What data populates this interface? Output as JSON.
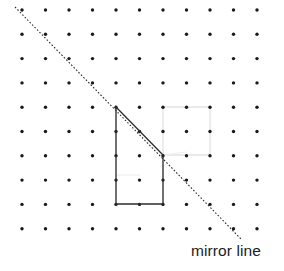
{
  "figure": {
    "background_color": "#ffffff",
    "width": 284,
    "height": 271
  },
  "labels": {
    "mirror_line": "mirror line"
  },
  "colors": {
    "dot": "#1a1a1a",
    "mirror_line": "#2b2b2b",
    "shape_outline": "#2d2d2d",
    "ghost_outline": "#e4e4e4",
    "text": "#1c1c1c"
  },
  "grid": {
    "kind": "square-dot-lattice",
    "columns": 11,
    "rows": 10,
    "x_start": 22,
    "y_start": 10,
    "spacing_x": 23.5,
    "spacing_y": 24.3,
    "dot_radius": 1.7,
    "xs": [
      22,
      45.5,
      69,
      92.5,
      116,
      139.5,
      163,
      186.5,
      210,
      233.5,
      257
    ],
    "ys": [
      10,
      34.3,
      58.6,
      82.9,
      107.2,
      131.5,
      155.8,
      180.1,
      204.4,
      228.7
    ]
  },
  "mirror_line": {
    "style": "dashed",
    "x1": 15,
    "y1": 7,
    "x2": 242,
    "y2": 240,
    "slope_description": "descending diagonal, gradient -1"
  },
  "shape": {
    "name": "object-shape",
    "description": "Vertical-sided quadrilateral with its upper-right corner cut by the mirror line",
    "points": [
      [
        116,
        107
      ],
      [
        163,
        155
      ],
      [
        163,
        204
      ],
      [
        116,
        204
      ]
    ],
    "closed": true
  },
  "ghost_shape": {
    "name": "reflected-shape-ghost",
    "description": "Faint erased outline of the reflected shape on the far side of the mirror line",
    "points": [
      [
        163,
        107
      ],
      [
        210,
        107
      ],
      [
        210,
        155
      ],
      [
        163,
        155
      ]
    ],
    "closed": true
  },
  "ghost_marks": {
    "segments": [
      [
        116,
        175,
        140,
        175
      ],
      [
        163,
        155,
        186,
        152
      ]
    ]
  }
}
